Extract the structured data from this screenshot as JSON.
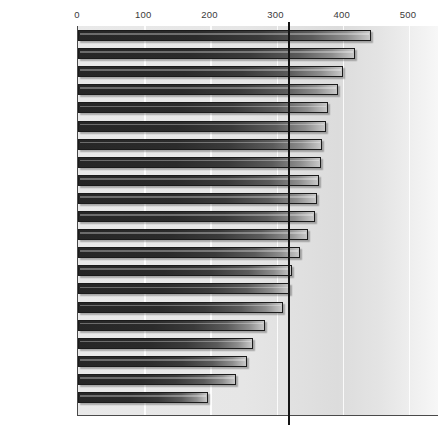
{
  "chart_data": {
    "type": "bar",
    "orientation": "horizontal",
    "title": "",
    "subtitle": "",
    "xlabel": "",
    "ylabel": "",
    "xlim": [
      0,
      500
    ],
    "ylim": null,
    "grid": true,
    "legend": null,
    "xticks": [
      0,
      100,
      200,
      300,
      400,
      500
    ],
    "xtick_labels": [
      "0",
      "100",
      "200",
      "300",
      "400",
      "500"
    ],
    "categories": [
      "Turkey",
      "Spain",
      "Nigeria",
      "Ireland",
      "Sweden",
      "United States",
      "Brazil",
      "Canada",
      "India",
      "Denmark",
      "Britain",
      "Italy",
      "Hungary",
      "Mexico",
      "France",
      "China",
      "Belgium",
      "Belarus",
      "Russia",
      "Finland",
      "Japan"
    ],
    "values": [
      442,
      418,
      400,
      392,
      377,
      374,
      368,
      367,
      364,
      361,
      358,
      348,
      336,
      323,
      320,
      309,
      283,
      265,
      256,
      239,
      197
    ],
    "highlighted_categories": [
      "Japan"
    ],
    "annotations": [
      {
        "name": "reference-line",
        "type": "vertical-line",
        "value": 317,
        "color": "#141414"
      }
    ]
  },
  "axis": {
    "ticks": [
      {
        "label": "0",
        "value": 0
      },
      {
        "label": "100",
        "value": 100
      },
      {
        "label": "200",
        "value": 200
      },
      {
        "label": "300",
        "value": 300
      },
      {
        "label": "400",
        "value": 400
      },
      {
        "label": "500",
        "value": 500
      }
    ]
  },
  "colors": {
    "bar_dark": "#262626",
    "bar_light": "#c8c8c8",
    "plot_background": "#e6e6e6",
    "axis": "#4a4a4a",
    "reference_line": "#141414",
    "gridline": "#ffffff",
    "label_text": "#2e2e2e"
  }
}
